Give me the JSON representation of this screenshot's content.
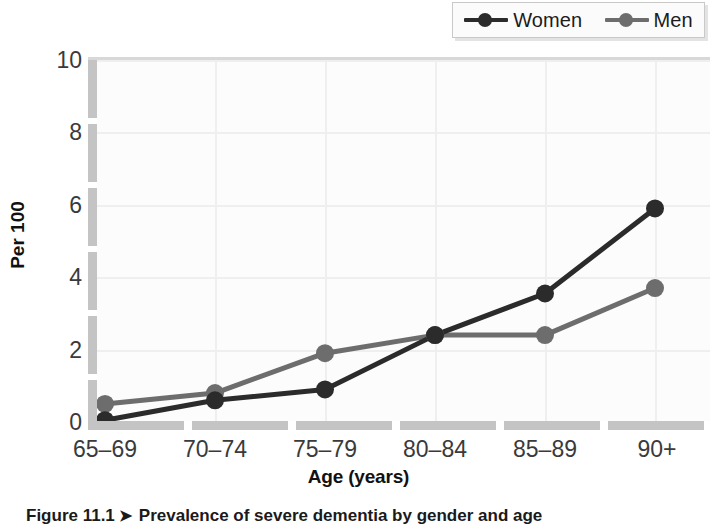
{
  "legend": {
    "position": "top-right",
    "entries": [
      {
        "label": "Women",
        "color": "#2b2b2b",
        "marker": "circle"
      },
      {
        "label": "Men",
        "color": "#6d6d6d",
        "marker": "circle"
      }
    ]
  },
  "axes": {
    "y_title": "Per 100",
    "x_title": "Age (years)",
    "y_ticks": [
      "0",
      "2",
      "4",
      "6",
      "8",
      "10"
    ],
    "x_ticks": [
      "65–69",
      "70–74",
      "75–79",
      "80–84",
      "85–89",
      "90+"
    ]
  },
  "caption": {
    "figure_number": "Figure 11.1",
    "arrow": "➤",
    "text": "Prevalence of severe dementia by gender and age"
  },
  "chart_data": {
    "type": "line",
    "title": "",
    "xlabel": "Age (years)",
    "ylabel": "Per 100",
    "categories": [
      "65–69",
      "70–74",
      "75–79",
      "80–84",
      "85–89",
      "90+"
    ],
    "series": [
      {
        "name": "Women",
        "color": "#2b2b2b",
        "values": [
          0.05,
          0.6,
          0.9,
          2.4,
          3.55,
          5.9
        ]
      },
      {
        "name": "Men",
        "color": "#6d6d6d",
        "values": [
          0.5,
          0.8,
          1.9,
          2.4,
          2.4,
          3.7
        ]
      }
    ],
    "ylim": [
      0,
      10
    ],
    "ytick_values": [
      0,
      2,
      4,
      6,
      8,
      10
    ],
    "grid": true,
    "legend_position": "top-right",
    "marker": "circle"
  }
}
